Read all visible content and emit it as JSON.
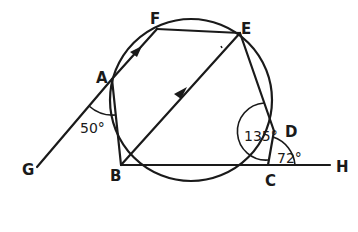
{
  "diagram": {
    "type": "cyclic-polygon-geometry",
    "circle": {
      "cx": 190,
      "cy": 100,
      "r": 80
    },
    "points": {
      "A": {
        "x": 112,
        "y": 79,
        "label": "A"
      },
      "F": {
        "x": 157,
        "y": 29,
        "label": "F"
      },
      "E": {
        "x": 240,
        "y": 33,
        "label": "E"
      },
      "D": {
        "x": 274,
        "y": 131,
        "label": "D"
      },
      "C": {
        "x": 268,
        "y": 165,
        "label": "C"
      },
      "B": {
        "x": 121,
        "y": 165,
        "label": "B"
      },
      "G": {
        "x": 37,
        "y": 167,
        "label": "G"
      },
      "H": {
        "x": 330,
        "y": 165,
        "label": "H"
      }
    },
    "angles": {
      "GAB": {
        "label": "50°",
        "value": 50
      },
      "EDC": {
        "label": "135°",
        "value": 135
      },
      "DCH": {
        "label": "72°",
        "value": 72
      }
    },
    "parallel_lines": [
      "AF",
      "BE"
    ]
  }
}
